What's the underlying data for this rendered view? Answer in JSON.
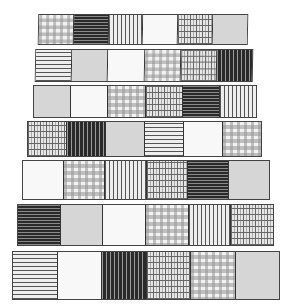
{
  "figure": {
    "strips": [
      {
        "cells": [
          "gingham",
          "dark-h",
          "vlines",
          "white",
          "grid",
          "gray"
        ]
      },
      {
        "cells": [
          "hlines",
          "gray",
          "white",
          "gingham",
          "grid",
          "dark-v"
        ]
      },
      {
        "cells": [
          "gray",
          "white",
          "gingham",
          "grid",
          "dark-h",
          "vlines"
        ]
      },
      {
        "cells": [
          "grid",
          "dark-v",
          "gray",
          "hlines",
          "white",
          "gingham"
        ]
      },
      {
        "cells": [
          "white",
          "gingham",
          "vlines",
          "grid",
          "dark-h",
          "gray"
        ]
      },
      {
        "cells": [
          "dark-h",
          "gray",
          "white",
          "gingham",
          "vlines",
          "grid"
        ]
      },
      {
        "cells": [
          "hlines",
          "white",
          "dark-v",
          "grid",
          "gingham",
          "gray"
        ]
      }
    ]
  }
}
